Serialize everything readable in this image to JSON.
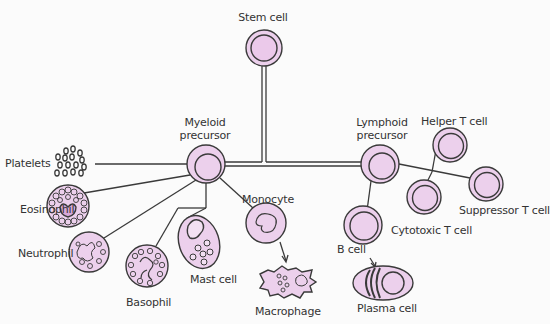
{
  "diagram": {
    "colors": {
      "cell_fill": "#ecd0ec",
      "stroke": "#3a3a3a",
      "background": "#fbfbfb"
    },
    "nodes": {
      "stem": {
        "label": "Stem cell"
      },
      "myeloid": {
        "label_line1": "Myeloid",
        "label_line2": "precursor"
      },
      "lymphoid": {
        "label_line1": "Lymphoid",
        "label_line2": "precursor"
      },
      "platelets": {
        "label": "Platelets"
      },
      "eosinophil": {
        "label": "Eosinophil"
      },
      "neutrophil": {
        "label": "Neutrophil"
      },
      "basophil": {
        "label": "Basophil"
      },
      "mast": {
        "label": "Mast cell"
      },
      "monocyte": {
        "label": "Monocyte"
      },
      "macrophage": {
        "label": "Macrophage"
      },
      "bcell": {
        "label": "B cell"
      },
      "plasma": {
        "label": "Plasma cell"
      },
      "helper": {
        "label": "Helper T cell"
      },
      "cytotoxic": {
        "label": "Cytotoxic T cell"
      },
      "suppressor": {
        "label": "Suppressor T cell"
      }
    },
    "edges": [
      [
        "Stem cell",
        "Myeloid precursor"
      ],
      [
        "Stem cell",
        "Lymphoid precursor"
      ],
      [
        "Myeloid precursor",
        "Platelets"
      ],
      [
        "Myeloid precursor",
        "Eosinophil"
      ],
      [
        "Myeloid precursor",
        "Neutrophil"
      ],
      [
        "Myeloid precursor",
        "Basophil"
      ],
      [
        "Myeloid precursor",
        "Mast cell"
      ],
      [
        "Myeloid precursor",
        "Monocyte"
      ],
      [
        "Monocyte",
        "Macrophage"
      ],
      [
        "Lymphoid precursor",
        "B cell"
      ],
      [
        "B cell",
        "Plasma cell"
      ],
      [
        "Lymphoid precursor",
        "Helper T cell"
      ],
      [
        "Lymphoid precursor",
        "Cytotoxic T cell"
      ],
      [
        "Lymphoid precursor",
        "Suppressor T cell"
      ]
    ]
  }
}
